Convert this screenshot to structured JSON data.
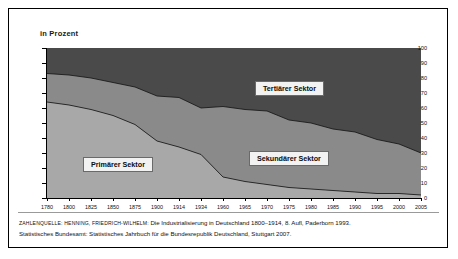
{
  "figure": {
    "axis_title": "in Prozent",
    "background": "#ffffff",
    "border_color": "#000000"
  },
  "source": {
    "label": "ZAHLENQUELLE:",
    "line1_author": "HENNING, FRIEDRICH-WILHELM:",
    "line1_rest": "Die Industrialisierung in Deutschland 1800–1914, 8. Aufl, Paderborn 1993.",
    "line2": "Statistisches Bundesamt: Statistisches Jahrbuch für die Bundesrepublik Deutschland, Stuttgart 2007."
  },
  "labels": {
    "primary": "Primärer Sektor",
    "secondary": "Sekundärer Sektor",
    "tertiary": "Tertiärer Sektor"
  },
  "chart_data": {
    "type": "area",
    "stacked": true,
    "title": "",
    "subtitle": "",
    "xlabel": "",
    "ylabel": "in Prozent",
    "ylim": [
      0,
      100
    ],
    "yticks": [
      0,
      10,
      20,
      30,
      40,
      50,
      60,
      70,
      80,
      90,
      100
    ],
    "grid": false,
    "legend_position": "inline-band-labels",
    "categories": [
      1780,
      1800,
      1825,
      1850,
      1875,
      1900,
      1914,
      1934,
      1960,
      1965,
      1970,
      1975,
      1980,
      1985,
      1990,
      1995,
      2000,
      2005
    ],
    "series": [
      {
        "name": "Primärer Sektor",
        "color": "#a8a8a8",
        "values": [
          64,
          62,
          59,
          55,
          49,
          38,
          34,
          29,
          14,
          11,
          9,
          7,
          6,
          5,
          4,
          3,
          3,
          2
        ]
      },
      {
        "name": "Sekundärer Sektor",
        "color": "#8a8a8a",
        "values": [
          19,
          20,
          21,
          22,
          25,
          30,
          33,
          31,
          47,
          48,
          49,
          45,
          44,
          41,
          40,
          36,
          33,
          28
        ]
      },
      {
        "name": "Tertiärer Sektor",
        "color": "#4a4a4a",
        "values": [
          17,
          18,
          20,
          23,
          26,
          32,
          33,
          40,
          39,
          41,
          42,
          48,
          50,
          54,
          56,
          61,
          64,
          70
        ]
      }
    ],
    "cumulative_primary_top": [
      64,
      62,
      59,
      55,
      49,
      38,
      34,
      29,
      14,
      11,
      9,
      7,
      6,
      5,
      4,
      3,
      3,
      2
    ],
    "cumulative_secondary_top": [
      83,
      82,
      80,
      77,
      74,
      68,
      67,
      60,
      61,
      59,
      58,
      52,
      50,
      46,
      44,
      39,
      36,
      30
    ]
  }
}
